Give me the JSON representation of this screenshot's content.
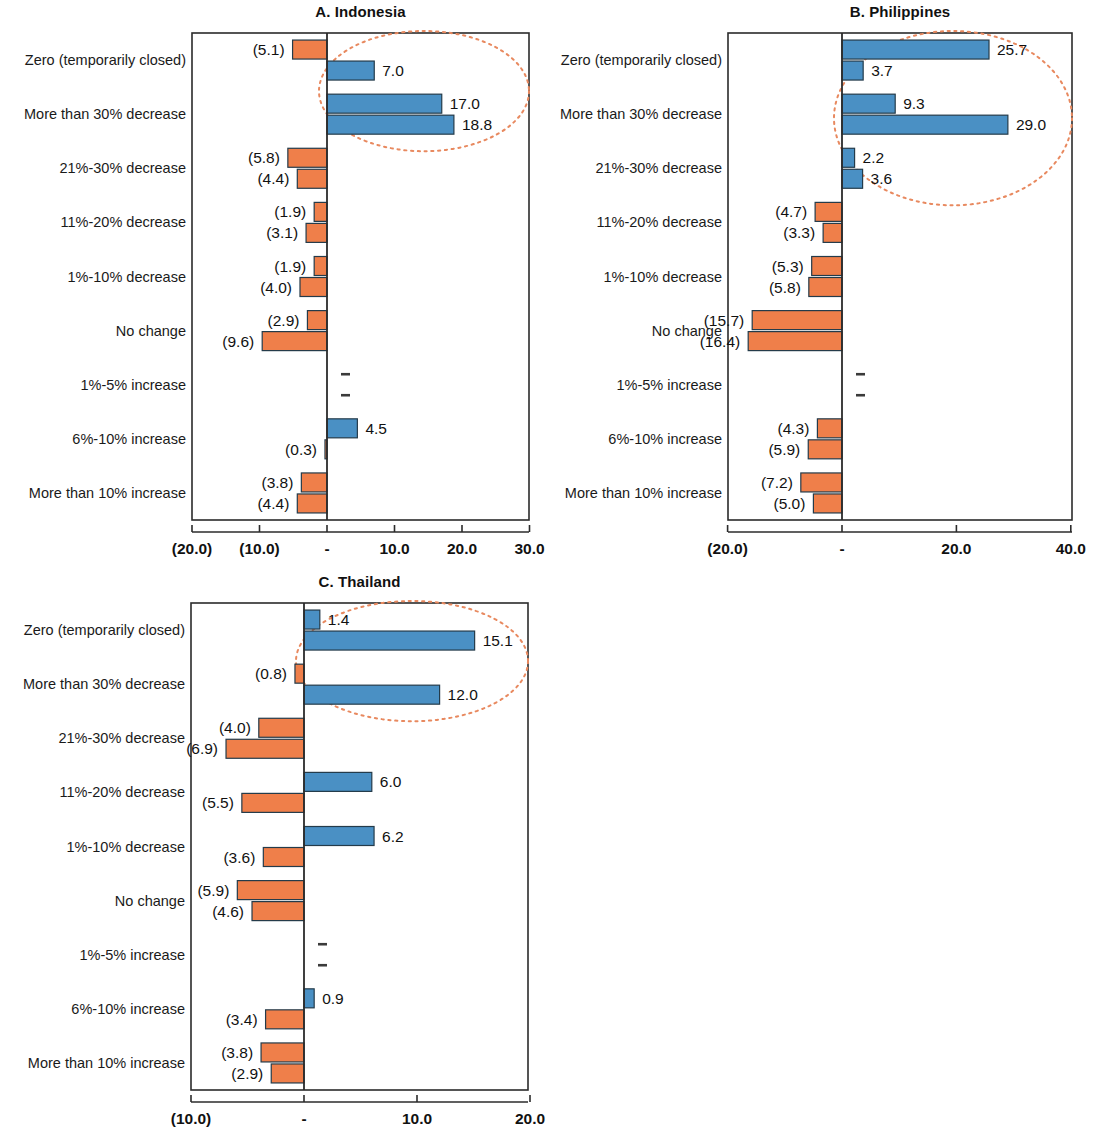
{
  "figure": {
    "categories": [
      "Zero (temporarily closed)",
      "More than 30% decrease",
      "21%-30% decrease",
      "11%-20% decrease",
      "1%-10% decrease",
      "No change",
      "1%-5% increase",
      "6%-10% increase",
      "More than 10% increase"
    ],
    "colors": {
      "positive_bar": "#4a90c4",
      "negative_bar": "#ef7f4a",
      "bar_outline": "#243b4a",
      "highlight_ellipse": "#e8895f",
      "axis": "#2b2b2b",
      "text": "#1a1a1a"
    }
  },
  "chart_data": [
    {
      "type": "bar",
      "title": "A. Indonesia",
      "panel_id": "A",
      "orientation": "horizontal-diverging",
      "xlabel": "",
      "ylabel": "",
      "xlim": [
        -20,
        30
      ],
      "ticks": [
        -20,
        -10,
        0,
        10,
        20,
        30
      ],
      "tick_labels": [
        "(20.0)",
        "(10.0)",
        "-",
        "10.0",
        "20.0",
        "30.0"
      ],
      "grid": false,
      "legend": "none",
      "categories": [
        "Zero (temporarily closed)",
        "More than 30% decrease",
        "21%-30% decrease",
        "11%-20% decrease",
        "1%-10% decrease",
        "No change",
        "1%-5% increase",
        "6%-10% increase",
        "More than 10% increase"
      ],
      "series": [
        {
          "name": "series-1",
          "values": [
            -5.1,
            17.0,
            -5.8,
            -1.9,
            -1.9,
            -2.9,
            0.0,
            4.5,
            -3.8
          ],
          "labels": [
            "(5.1)",
            "17.0",
            "(5.8)",
            "(1.9)",
            "(1.9)",
            "(2.9)",
            "-",
            "4.5",
            "(3.8)"
          ]
        },
        {
          "name": "series-2",
          "values": [
            7.0,
            18.8,
            -4.4,
            -3.1,
            -4.0,
            -9.6,
            0.0,
            -0.3,
            -4.4
          ],
          "labels": [
            "7.0",
            "18.8",
            "(4.4)",
            "(3.1)",
            "(4.0)",
            "(9.6)",
            "-",
            "(0.3)",
            "(4.4)"
          ]
        }
      ],
      "annotation": {
        "type": "ellipse",
        "covers": [
          "Zero (temporarily closed)",
          "More than 30% decrease"
        ]
      }
    },
    {
      "type": "bar",
      "title": "B. Philippines",
      "panel_id": "B",
      "orientation": "horizontal-diverging",
      "xlabel": "",
      "ylabel": "",
      "xlim": [
        -20,
        40
      ],
      "ticks": [
        -20,
        0,
        20,
        40
      ],
      "tick_labels": [
        "(20.0)",
        "-",
        "20.0",
        "40.0"
      ],
      "grid": false,
      "legend": "none",
      "categories": [
        "Zero (temporarily closed)",
        "More than 30% decrease",
        "21%-30% decrease",
        "11%-20% decrease",
        "1%-10% decrease",
        "No change",
        "1%-5% increase",
        "6%-10% increase",
        "More than 10% increase"
      ],
      "series": [
        {
          "name": "series-1",
          "values": [
            25.7,
            9.3,
            2.2,
            -4.7,
            -5.3,
            -15.7,
            0.0,
            -4.3,
            -7.2
          ],
          "labels": [
            "25.7",
            "9.3",
            "2.2",
            "(4.7)",
            "(5.3)",
            "(15.7)",
            "-",
            "(4.3)",
            "(7.2)"
          ]
        },
        {
          "name": "series-2",
          "values": [
            3.7,
            29.0,
            3.6,
            -3.3,
            -5.8,
            -16.4,
            0.0,
            -5.9,
            -5.0
          ],
          "labels": [
            "3.7",
            "29.0",
            "3.6",
            "(3.3)",
            "(5.8)",
            "(16.4)",
            "-",
            "(5.9)",
            "(5.0)"
          ]
        }
      ],
      "annotation": {
        "type": "ellipse",
        "covers": [
          "Zero (temporarily closed)",
          "More than 30% decrease",
          "21%-30% decrease"
        ]
      }
    },
    {
      "type": "bar",
      "title": "C. Thailand",
      "panel_id": "C",
      "orientation": "horizontal-diverging",
      "xlabel": "",
      "ylabel": "",
      "xlim": [
        -10,
        20
      ],
      "ticks": [
        -10,
        0,
        10,
        20
      ],
      "tick_labels": [
        "(10.0)",
        "-",
        "10.0",
        "20.0"
      ],
      "grid": false,
      "legend": "none",
      "categories": [
        "Zero (temporarily closed)",
        "More than 30% decrease",
        "21%-30% decrease",
        "11%-20% decrease",
        "1%-10% decrease",
        "No change",
        "1%-5% increase",
        "6%-10% increase",
        "More than 10% increase"
      ],
      "series": [
        {
          "name": "series-1",
          "values": [
            1.4,
            -0.8,
            -4.0,
            6.0,
            6.2,
            -5.9,
            0.0,
            0.9,
            -3.8
          ],
          "labels": [
            "1.4",
            "(0.8)",
            "(4.0)",
            "6.0",
            "6.2",
            "(5.9)",
            "-",
            "0.9",
            "(3.8)"
          ]
        },
        {
          "name": "series-2",
          "values": [
            15.1,
            12.0,
            -6.9,
            -5.5,
            -3.6,
            -4.6,
            0.0,
            -3.4,
            -2.9
          ],
          "labels": [
            "15.1",
            "12.0",
            "(6.9)",
            "(5.5)",
            "(3.6)",
            "(4.6)",
            "-",
            "(3.4)",
            "(2.9)"
          ]
        }
      ],
      "annotation": {
        "type": "ellipse",
        "covers": [
          "Zero (temporarily closed)",
          "More than 30% decrease"
        ]
      }
    }
  ]
}
